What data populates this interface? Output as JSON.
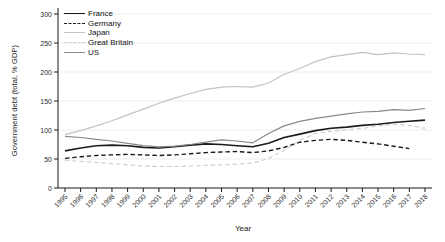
{
  "figure": {
    "background": "#ffffff",
    "axis_color": "#1a1a1a",
    "grid_color": "#ededed"
  },
  "chart_data": {
    "type": "line",
    "title": "",
    "xlabel": "Year",
    "ylabel": "Government debt (total, % GDP)",
    "x": [
      1995,
      1996,
      1997,
      1998,
      1999,
      2000,
      2001,
      2002,
      2003,
      2004,
      2005,
      2006,
      2007,
      2008,
      2009,
      2010,
      2011,
      2012,
      2013,
      2014,
      2015,
      2016,
      2017,
      2018
    ],
    "ylim": [
      0,
      300
    ],
    "yticks": [
      0,
      50,
      100,
      150,
      200,
      250,
      300
    ],
    "grid": true,
    "legend_position": "top-left",
    "series": [
      {
        "name": "France",
        "color": "#1a1a1a",
        "dash": "solid",
        "width": 1.6,
        "values": [
          64,
          69,
          73,
          74,
          73,
          70,
          69,
          71,
          74,
          76,
          75,
          73,
          71,
          77,
          87,
          93,
          99,
          103,
          105,
          108,
          110,
          113,
          115,
          117
        ]
      },
      {
        "name": "Germany",
        "color": "#1a1a1a",
        "dash": "dashed",
        "width": 1.4,
        "values": [
          51,
          54,
          56,
          57,
          58,
          57,
          56,
          57,
          59,
          61,
          62,
          63,
          61,
          64,
          70,
          79,
          82,
          84,
          82,
          79,
          76,
          72,
          68,
          null
        ]
      },
      {
        "name": "Japan",
        "color": "#c3c3c3",
        "dash": "solid",
        "width": 1.2,
        "values": [
          92,
          99,
          107,
          116,
          126,
          136,
          146,
          155,
          163,
          170,
          174,
          175,
          174,
          181,
          196,
          206,
          218,
          226,
          230,
          234,
          230,
          233,
          231,
          230
        ]
      },
      {
        "name": "Great Britain",
        "color": "#d0d0d0",
        "dash": "dashed",
        "width": 1.2,
        "values": [
          48,
          46,
          44,
          42,
          40,
          38,
          37,
          37,
          38,
          39,
          40,
          41,
          43,
          51,
          65,
          82,
          94,
          98,
          100,
          103,
          107,
          110,
          108,
          103
        ]
      },
      {
        "name": "US",
        "color": "#8a8a8a",
        "dash": "solid",
        "width": 1.2,
        "values": [
          89,
          87,
          84,
          81,
          77,
          73,
          71,
          72,
          75,
          79,
          83,
          81,
          78,
          94,
          107,
          115,
          120,
          124,
          128,
          131,
          132,
          135,
          134,
          137
        ]
      }
    ]
  }
}
